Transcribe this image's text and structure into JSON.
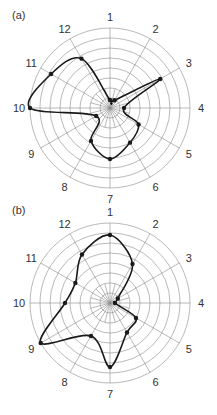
{
  "chart_data": [
    {
      "type": "polar-line",
      "panel_label": "(a)",
      "title": "",
      "categories": [
        "1",
        "2",
        "3",
        "4",
        "5",
        "6",
        "7",
        "8",
        "9",
        "10",
        "11",
        "12"
      ],
      "angles_deg": [
        0,
        30,
        60,
        90,
        120,
        150,
        180,
        210,
        240,
        270,
        300,
        330
      ],
      "values": [
        0.8,
        0.9,
        5.8,
        1.4,
        3.3,
        4.0,
        5.1,
        3.8,
        1.6,
        8.0,
        6.8,
        5.7
      ],
      "rlim": [
        0,
        8
      ],
      "rings": 8,
      "grid": true,
      "legend": null
    },
    {
      "type": "polar-line",
      "panel_label": "(b)",
      "title": "",
      "categories": [
        "1",
        "2",
        "3",
        "4",
        "5",
        "6",
        "7",
        "8",
        "9",
        "10",
        "11",
        "12"
      ],
      "angles_deg": [
        0,
        30,
        60,
        90,
        120,
        150,
        180,
        210,
        240,
        270,
        300,
        330
      ],
      "values": [
        6.8,
        4.5,
        0.9,
        0.5,
        3.0,
        3.4,
        6.4,
        3.8,
        8.0,
        4.5,
        4.0,
        5.6
      ],
      "rlim": [
        0,
        8
      ],
      "rings": 8,
      "grid": true,
      "legend": null
    }
  ],
  "layout": {
    "panels": [
      {
        "cx": 110,
        "cy": 108,
        "radius": 80,
        "label_radius": 91,
        "panel_label_x": 12,
        "panel_label_y": 19
      },
      {
        "cx": 110,
        "cy": 303,
        "radius": 80,
        "label_radius": 91,
        "panel_label_x": 12,
        "panel_label_y": 214
      }
    ],
    "colors": {
      "line": "#1a1a1a",
      "grid": "#8a8a8a",
      "text": "#333333"
    }
  }
}
